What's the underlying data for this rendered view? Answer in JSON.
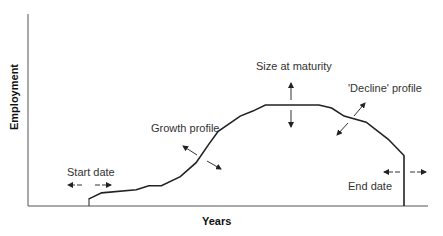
{
  "axes": {
    "x_label": "Years",
    "y_label": "Employment"
  },
  "annotations": {
    "start_date": "Start date",
    "growth_profile": "Growth profile",
    "size_at_maturity": "Size at maturity",
    "decline_profile": "'Decline' profile",
    "end_date": "End date"
  },
  "chart_data": {
    "type": "line",
    "title": "",
    "xlabel": "Years",
    "ylabel": "Employment",
    "grid": false,
    "x": [
      0,
      0.04,
      0.15,
      0.19,
      0.23,
      0.29,
      0.34,
      0.38,
      0.41,
      0.48,
      0.52,
      0.56,
      0.73,
      0.77,
      0.81,
      0.88,
      0.95,
      1.0,
      1.0
    ],
    "y": [
      0.07,
      0.13,
      0.16,
      0.2,
      0.2,
      0.29,
      0.43,
      0.61,
      0.74,
      0.89,
      0.94,
      1.0,
      1.0,
      0.97,
      0.89,
      0.83,
      0.66,
      0.5,
      0
    ]
  }
}
